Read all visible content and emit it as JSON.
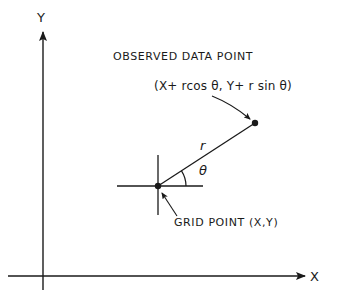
{
  "diagram": {
    "axes": {
      "x_label": "X",
      "y_label": "Y"
    },
    "observed_point": {
      "title": "OBSERVED DATA POINT",
      "formula": "(X+ rcos θ, Y+ r sin θ)"
    },
    "grid_point": {
      "label": "GRID POINT (X,Y)"
    },
    "symbols": {
      "radius": "r",
      "angle": "θ"
    },
    "colors": {
      "ink": "#1a1a1a",
      "background": "#ffffff"
    }
  }
}
